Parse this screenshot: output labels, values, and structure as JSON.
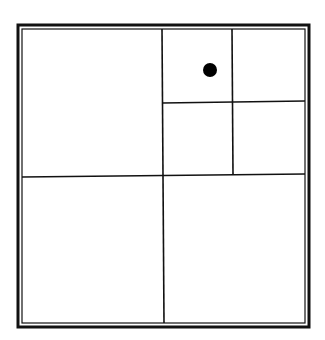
{
  "diagram": {
    "type": "quadtree-subdivision",
    "background": "#ffffff",
    "line_color": "#111111",
    "frame": {
      "outer": {
        "x1": 18,
        "y1": 25,
        "x2": 309,
        "y2": 327,
        "stroke_width": 3
      },
      "inner": {
        "x1": 22,
        "y1": 29,
        "x2": 305,
        "y2": 323,
        "stroke_width": 1.2
      }
    },
    "lines": [
      {
        "name": "main-vertical-divider",
        "x1": 162,
        "y1": 29,
        "x2": 164,
        "y2": 323,
        "stroke_width": 1.6
      },
      {
        "name": "main-horizontal-divider",
        "x1": 22,
        "y1": 177,
        "x2": 305,
        "y2": 174,
        "stroke_width": 1.6
      },
      {
        "name": "subquad-vertical-divider",
        "x1": 232,
        "y1": 29,
        "x2": 233,
        "y2": 175,
        "stroke_width": 1.6
      },
      {
        "name": "subquad-horizontal-divider",
        "x1": 162,
        "y1": 103,
        "x2": 305,
        "y2": 101,
        "stroke_width": 1.6
      }
    ],
    "cells": [
      {
        "name": "cell-top-left",
        "level": 1
      },
      {
        "name": "cell-bottom-left",
        "level": 1
      },
      {
        "name": "cell-bottom-right",
        "level": 1
      },
      {
        "name": "cell-top-right-nw",
        "level": 2,
        "contains_point": true
      },
      {
        "name": "cell-top-right-ne",
        "level": 2
      },
      {
        "name": "cell-top-right-sw",
        "level": 2
      },
      {
        "name": "cell-top-right-se",
        "level": 2
      }
    ],
    "point": {
      "cx": 210,
      "cy": 70,
      "r": 7,
      "color": "#000000"
    }
  }
}
